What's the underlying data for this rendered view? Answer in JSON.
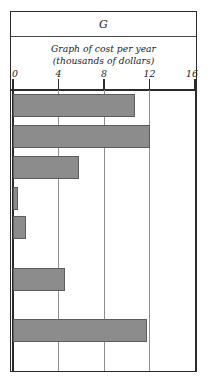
{
  "figure": {
    "title": "G",
    "subtitle_lines": [
      "Graph of cost per year",
      "(thousands of dollars)"
    ]
  },
  "chart_data": {
    "type": "bar",
    "orientation": "horizontal",
    "title": "G",
    "subtitle": "Graph of cost per year (thousands of dollars)",
    "xlabel": "thousands of dollars",
    "ylabel": "",
    "xlim": [
      0,
      16
    ],
    "ylim": [
      0,
      7
    ],
    "grid": true,
    "gridlines_x": [
      0,
      4,
      8,
      12,
      16
    ],
    "legend": null,
    "tick_labels": [
      "0",
      "4",
      "8",
      "12",
      "16"
    ],
    "categories": [
      "",
      "",
      "",
      "",
      "",
      "",
      ""
    ],
    "values": [
      10.7,
      12.0,
      5.8,
      0.4,
      1.1,
      4.6,
      11.8
    ],
    "bar_color": "#8c8c8c",
    "bar_edge_color": "#5c5c5c",
    "frame_color": "#2b2b2b",
    "background": "#ffffff"
  },
  "bars": [
    {
      "index": 1,
      "value": 10.7,
      "top": 4,
      "height": 23
    },
    {
      "index": 2,
      "value": 12.0,
      "top": 35,
      "height": 23
    },
    {
      "index": 3,
      "value": 5.8,
      "top": 66,
      "height": 23
    },
    {
      "index": 4,
      "value": 0.4,
      "top": 97,
      "height": 23
    },
    {
      "index": 5,
      "value": 1.1,
      "top": 126,
      "height": 23
    },
    {
      "index": 6,
      "value": 4.6,
      "top": 178,
      "height": 23
    },
    {
      "index": 7,
      "value": 11.8,
      "top": 229,
      "height": 23
    }
  ]
}
